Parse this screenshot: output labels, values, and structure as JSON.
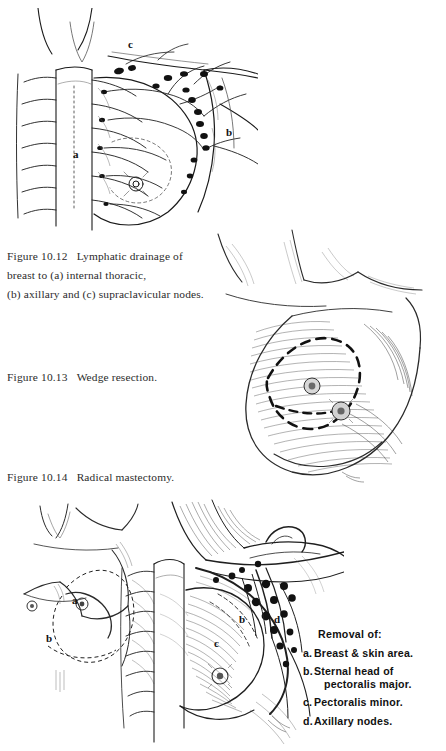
{
  "page": {
    "background": "#ffffff",
    "ink": "#1a1a1a",
    "kind": "textbook-illustration-page"
  },
  "figures": [
    {
      "id": "figure-10-12",
      "number": "Figure 10.12",
      "caption_lines": [
        "Lymphatic drainage of",
        "breast to (a) internal thoracic,",
        "(b) axillary and (c) supraclavicular nodes."
      ],
      "caption_full": "Figure 10.12   Lymphatic drainage of breast to (a) internal thoracic, (b) axillary and (c) supraclavicular nodes.",
      "labels": [
        {
          "key": "a",
          "meaning": "internal thoracic nodes",
          "x": 73,
          "y": 148
        },
        {
          "key": "b",
          "meaning": "axillary nodes",
          "x": 226,
          "y": 126
        },
        {
          "key": "c",
          "meaning": "supraclavicular nodes",
          "x": 128,
          "y": 38
        }
      ]
    },
    {
      "id": "figure-10-13",
      "number": "Figure 10.13",
      "caption_lines": [
        "Wedge resection."
      ],
      "caption_full": "Figure 10.13   Wedge resection.",
      "labels": []
    },
    {
      "id": "figure-10-14",
      "number": "Figure 10.14",
      "caption_lines": [
        "Radical mastectomy."
      ],
      "caption_full": "Figure 10.14   Radical mastectomy.",
      "labels": [
        {
          "key": "a",
          "meaning": "breast and skin area",
          "x": 72,
          "y": 594
        },
        {
          "key": "b",
          "meaning": "sternal head of pectoralis major",
          "x": 46,
          "y": 634
        },
        {
          "key": "b2",
          "meaning": "sternal head of pectoralis major",
          "x": 240,
          "y": 620
        },
        {
          "key": "c",
          "meaning": "pectoralis minor",
          "x": 216,
          "y": 643
        },
        {
          "key": "d",
          "meaning": "axillary nodes",
          "x": 275,
          "y": 619
        }
      ]
    }
  ],
  "legend": {
    "title": "Removal  of:",
    "items": [
      {
        "key": "a.",
        "text": "Breast & skin  area.",
        "continuation": ""
      },
      {
        "key": "b.",
        "text": "Sternal   head  of",
        "continuation": "pectoralis   major."
      },
      {
        "key": "c.",
        "text": "Pectoralis   minor.",
        "continuation": ""
      },
      {
        "key": "d.",
        "text": "Axillary  nodes.",
        "continuation": ""
      }
    ]
  }
}
